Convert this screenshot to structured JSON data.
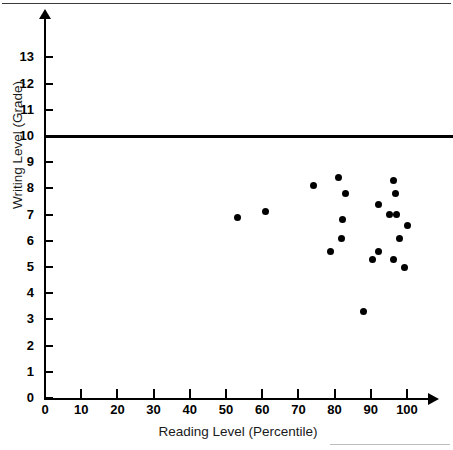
{
  "chart_data": {
    "type": "scatter",
    "title": "",
    "xlabel": "Reading Level (Percentile)",
    "ylabel": "Writing Level (Grade)",
    "xlim": [
      0,
      106
    ],
    "ylim": [
      0,
      13.7
    ],
    "grid": false,
    "legend": "none",
    "x_ticks": [
      0,
      10,
      20,
      30,
      40,
      50,
      60,
      70,
      80,
      90,
      100
    ],
    "y_ticks": [
      0,
      1,
      2,
      3,
      4,
      5,
      6,
      7,
      8,
      9,
      10,
      11,
      12,
      13
    ],
    "x_tick_labels": [
      "0",
      "10",
      "20",
      "30",
      "40",
      "50",
      "60",
      "70",
      "80",
      "90",
      "100"
    ],
    "y_tick_labels": [
      "0",
      "1",
      "2",
      "3",
      "4",
      "5",
      "6",
      "7",
      "8",
      "9",
      "10",
      "11",
      "12",
      "13"
    ],
    "series": [
      {
        "name": "students",
        "marker": "filled-circle",
        "color": "#000000",
        "points": [
          {
            "x": 53.3,
            "y": 6.9
          },
          {
            "x": 61.0,
            "y": 7.1
          },
          {
            "x": 74.3,
            "y": 8.1
          },
          {
            "x": 79.0,
            "y": 5.6
          },
          {
            "x": 81.0,
            "y": 8.4
          },
          {
            "x": 81.8,
            "y": 6.1
          },
          {
            "x": 82.3,
            "y": 6.8
          },
          {
            "x": 83.1,
            "y": 7.8
          },
          {
            "x": 88.1,
            "y": 3.3
          },
          {
            "x": 90.6,
            "y": 5.3
          },
          {
            "x": 92.0,
            "y": 7.4
          },
          {
            "x": 92.0,
            "y": 5.6
          },
          {
            "x": 95.3,
            "y": 7.0
          },
          {
            "x": 96.4,
            "y": 8.3
          },
          {
            "x": 96.4,
            "y": 5.3
          },
          {
            "x": 96.7,
            "y": 7.8
          },
          {
            "x": 97.0,
            "y": 7.0
          },
          {
            "x": 97.8,
            "y": 6.1
          },
          {
            "x": 99.2,
            "y": 5.0
          },
          {
            "x": 100.0,
            "y": 6.6
          }
        ]
      }
    ],
    "reference_lines": [
      {
        "orientation": "horizontal",
        "value": 10,
        "color": "#000000",
        "width": 3
      }
    ]
  }
}
